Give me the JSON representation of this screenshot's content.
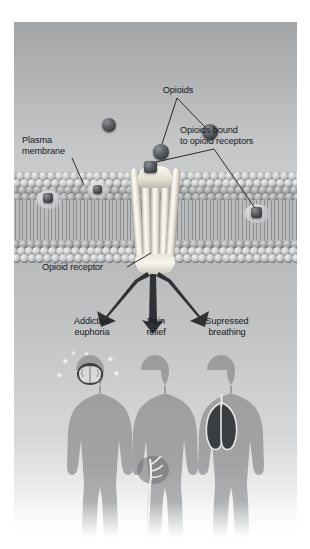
{
  "figure": {
    "type": "biology-illustration"
  },
  "labels": {
    "opioids": "Opioids",
    "plasma_membrane": "Plasma\nmembrane",
    "bound": "Opioids bound\nto opioid receptors",
    "opioid_receptor": "Opioid receptor",
    "effect_1": "Addictive\neuphoria",
    "effect_2": "Pain\nrelief",
    "effect_3": "Supressed\nbreathing"
  },
  "colors": {
    "text": "#17191b",
    "opioid": "#3f4246",
    "receptor": "#f2efe6",
    "membrane_head": "#c8cacc",
    "body": "#9ea0a2",
    "arrow": "#2f3134",
    "background_top": "#a2a4a6",
    "background_bottom": "#ffffff"
  },
  "free_opioids": [
    {
      "x": 95,
      "y": 103,
      "r": 7
    },
    {
      "x": 147,
      "y": 130,
      "r": 8
    },
    {
      "x": 196,
      "y": 110,
      "r": 8
    }
  ],
  "bound_opioids": [
    {
      "x": 33,
      "y": 177,
      "label": "left-bound"
    },
    {
      "x": 83,
      "y": 168,
      "label": "left-surface"
    },
    {
      "x": 136,
      "y": 193,
      "label": "center-receptor-bound"
    },
    {
      "x": 242,
      "y": 192,
      "label": "right-bound"
    }
  ],
  "effects": [
    {
      "id": "euphoria",
      "organ": "brain",
      "label": "Addictive\neuphoria"
    },
    {
      "id": "analgesia",
      "organ": "nerve",
      "label": "Pain\nrelief"
    },
    {
      "id": "resp",
      "organ": "lungs",
      "label": "Supressed\nbreathing"
    }
  ]
}
